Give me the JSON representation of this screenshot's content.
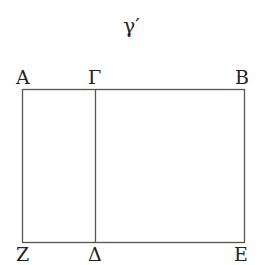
{
  "title": "γ′",
  "points": {
    "A": "Α",
    "G": "Γ",
    "B": "Β",
    "Z": "Ζ",
    "D": "Δ",
    "E": "Ε"
  },
  "colors": {
    "line": "#555555",
    "text": "#222222"
  }
}
